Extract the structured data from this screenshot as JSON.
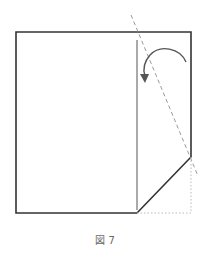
{
  "figure": {
    "caption": "図 7",
    "colors": {
      "outline": "#333333",
      "inner_crease": "#555555",
      "fold_line": "#999999",
      "hidden_edge": "#bbbbbb",
      "arrow": "#555555"
    },
    "elements": {
      "paper_outline": "folded-paper-outline",
      "inner_crease": "vertical-crease-line",
      "fold_line": "diagonal-dashed-valley-fold-line",
      "hidden_corner": "dotted-original-corner-outline",
      "fold_arrow": "curved-fold-arrow"
    }
  }
}
